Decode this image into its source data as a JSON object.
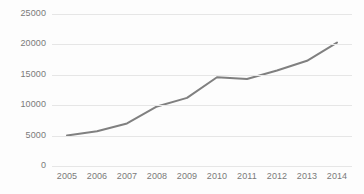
{
  "chart_data": {
    "type": "line",
    "title": "",
    "subtitle": "",
    "xlabel": "",
    "ylabel": "",
    "categories": [
      "2005",
      "2006",
      "2007",
      "2008",
      "2009",
      "2010",
      "2011",
      "2012",
      "2013",
      "2014"
    ],
    "series": [
      {
        "name": "",
        "values": [
          5000,
          5700,
          7000,
          9800,
          11200,
          14600,
          14300,
          15700,
          17300,
          20300
        ],
        "color": "#808080",
        "line_width": 2,
        "markers": false
      }
    ],
    "ylim": [
      0,
      25000
    ],
    "yticks": [
      0,
      5000,
      10000,
      15000,
      20000,
      25000
    ],
    "ytick_labels": [
      "0",
      "5000",
      "10000",
      "15000",
      "20000",
      "25000"
    ],
    "xtick_labels": [
      "2005",
      "2006",
      "2007",
      "2008",
      "2009",
      "2010",
      "2011",
      "2012",
      "2013",
      "2014"
    ],
    "grid": true,
    "grid_axis": "y",
    "grid_color": "#e6e6e6",
    "legend": false,
    "legend_position": "none",
    "background_color": "#fdfdfd",
    "tick_label_color": "#7a7a7a",
    "annotations": []
  }
}
